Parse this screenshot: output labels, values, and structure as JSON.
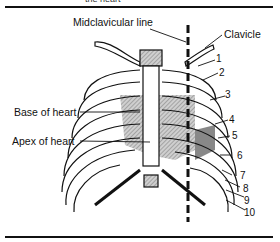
{
  "figure": {
    "caption_partial": "the heart",
    "labels": {
      "midclavicular": "Midclavicular line",
      "clavicle": "Clavicle",
      "base": "Base of heart",
      "apex": "Apex of heart"
    },
    "rib_numbers": [
      "1",
      "2",
      "3",
      "4",
      "5",
      "6",
      "7",
      "8",
      "9",
      "10"
    ]
  }
}
